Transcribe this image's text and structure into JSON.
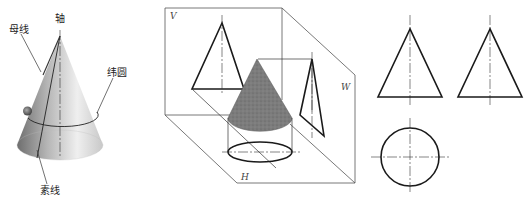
{
  "figure1": {
    "title": "cone with terms",
    "labels": {
      "axis": "轴",
      "generatrix": "母线",
      "latitude_circle": "纬圆",
      "element_line": "素线"
    }
  },
  "figure2": {
    "title": "three-plane projection of cone",
    "planes": {
      "vertical": "V",
      "horizontal": "H",
      "side": "W"
    }
  },
  "figure3": {
    "title": "orthographic views",
    "views": [
      "front view (triangle)",
      "side view (triangle)",
      "top view (circle)"
    ]
  },
  "colors": {
    "line": "#1a1a1a",
    "cone_shaded": "#7a7a7a",
    "cone_gradient_light": "#f2f2f2",
    "cone_gradient_dark": "#8a8a8a"
  }
}
